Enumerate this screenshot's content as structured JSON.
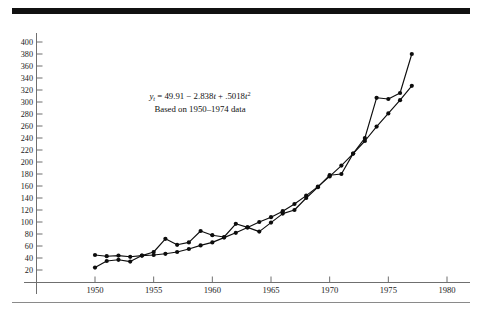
{
  "figure": {
    "top_rule_color": "#111111",
    "bottom_rule_color": "#8a8a8a",
    "background": "#ffffff"
  },
  "annotation": {
    "equation_line": "y_t = 49.91 − 2.838t + .5018t²",
    "equation_prefix": "y",
    "equation_sub": "t",
    "equation_body": " = 49.91 − 2.838",
    "equation_t1": "t",
    "equation_mid": " + .5018",
    "equation_t2": "t",
    "equation_sup": "2",
    "subtitle": "Based on 1950–1974 data"
  },
  "chart_data": {
    "type": "line",
    "title": "",
    "xlabel": "",
    "ylabel": "",
    "xlim": [
      1948.7,
      1982.0
    ],
    "ylim": [
      0,
      410
    ],
    "grid": false,
    "legend": "none",
    "xticks": [
      1950,
      1955,
      1960,
      1965,
      1970,
      1975,
      1980
    ],
    "xtick_labels": [
      "1950",
      "1955",
      "1960",
      "1965",
      "1970",
      "1975",
      "1980"
    ],
    "yticks": [
      20,
      40,
      60,
      80,
      100,
      120,
      140,
      160,
      180,
      200,
      220,
      240,
      260,
      280,
      300,
      320,
      340,
      360,
      380,
      400
    ],
    "ytick_labels": [
      "20",
      "40",
      "60",
      "80",
      "100",
      "120",
      "140",
      "160",
      "180",
      "200",
      "220",
      "240",
      "260",
      "280",
      "300",
      "320",
      "340",
      "360",
      "380",
      "400"
    ],
    "marker": "filled-circle",
    "series": [
      {
        "name": "actual",
        "x": [
          1950,
          1951,
          1952,
          1953,
          1954,
          1955,
          1956,
          1957,
          1958,
          1959,
          1960,
          1961,
          1962,
          1963,
          1964,
          1965,
          1966,
          1967,
          1968,
          1969,
          1970,
          1971,
          1972,
          1973,
          1974,
          1975,
          1976,
          1977
        ],
        "values": [
          45,
          43,
          44,
          42,
          44,
          50,
          72,
          62,
          66,
          85,
          78,
          75,
          97,
          91,
          84,
          99,
          114,
          120,
          140,
          158,
          178,
          180,
          214,
          240,
          307,
          305,
          315,
          380
        ]
      },
      {
        "name": "fitted",
        "x": [
          1950,
          1951,
          1952,
          1953,
          1954,
          1955,
          1956,
          1957,
          1958,
          1959,
          1960,
          1961,
          1962,
          1963,
          1964,
          1965,
          1966,
          1967,
          1968,
          1969,
          1970,
          1971,
          1972,
          1973,
          1974,
          1975,
          1976,
          1977
        ],
        "values": [
          24,
          35,
          37,
          34,
          44,
          45,
          47,
          50,
          55,
          61,
          66,
          74,
          82,
          91,
          100,
          108,
          118,
          130,
          144,
          159,
          176,
          194,
          214,
          235,
          259,
          281,
          303,
          327
        ]
      }
    ]
  }
}
